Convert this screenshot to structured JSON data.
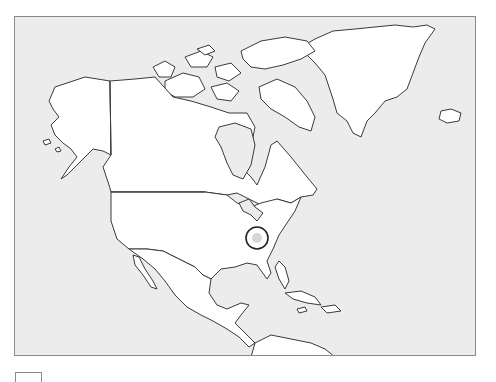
{
  "map": {
    "region": "North America",
    "projection": "outline",
    "colors": {
      "ocean": "#ececec",
      "land": "#ffffff",
      "coastline": "#3a3a3a",
      "frame": "#8a8a8a",
      "marker_ring": "#222222",
      "marker_fill": "#d6d6d6"
    },
    "marker": {
      "cx": 242,
      "cy": 221,
      "r": 11,
      "label": ""
    }
  },
  "legend": {
    "label": ""
  }
}
